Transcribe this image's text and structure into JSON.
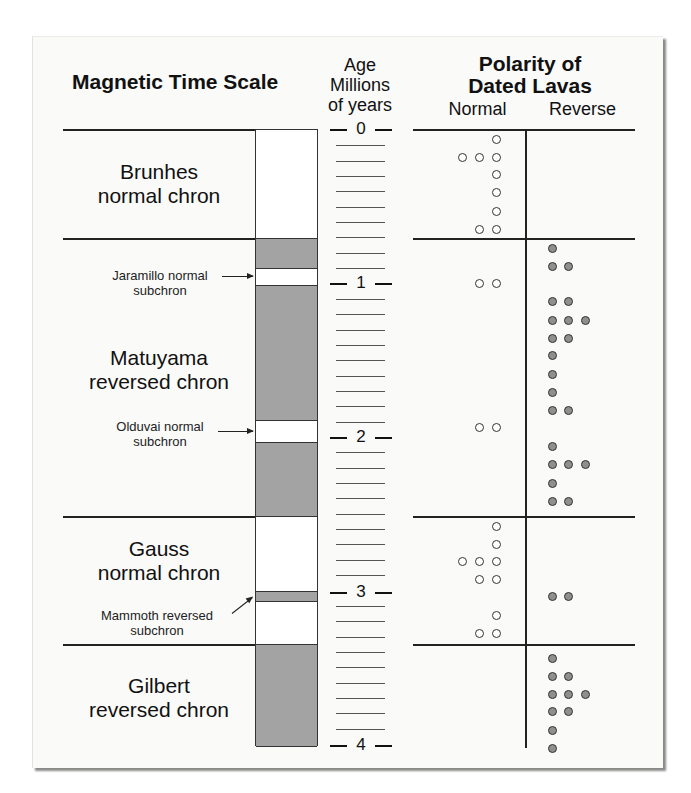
{
  "figure": {
    "title_left": "Magnetic Time Scale",
    "age_header": {
      "line1": "Age",
      "line2": "Millions",
      "line3": "of years"
    },
    "polarity_header": {
      "line1": "Polarity of",
      "line2": "Dated Lavas"
    },
    "column_normal": "Normal",
    "column_reverse": "Reverse",
    "colors": {
      "reversed_fill": "#a3a3a3",
      "normal_fill": "#ffffff",
      "reverse_dot": "#8f8f8f",
      "normal_dot": "#ffffff"
    }
  },
  "chrons": [
    {
      "name_line1": "Brunhes",
      "name_line2": "normal chron",
      "polarity": "normal",
      "start_ma": 0,
      "end_ma": 0.7
    },
    {
      "name_line1": "Matuyama",
      "name_line2": "reversed chron",
      "polarity": "reversed",
      "start_ma": 0.7,
      "end_ma": 2.5
    },
    {
      "name_line1": "Gauss",
      "name_line2": "normal chron",
      "polarity": "normal",
      "start_ma": 2.5,
      "end_ma": 3.3
    },
    {
      "name_line1": "Gilbert",
      "name_line2": "reversed chron",
      "polarity": "reversed",
      "start_ma": 3.3,
      "end_ma": 4.0
    }
  ],
  "subchrons": [
    {
      "name_line1": "Jaramillo normal",
      "name_line2": "subchron",
      "polarity": "normal",
      "start_ma": 0.9,
      "end_ma": 1.0
    },
    {
      "name_line1": "Olduvai normal",
      "name_line2": "subchron",
      "polarity": "normal",
      "start_ma": 1.9,
      "end_ma": 2.0
    },
    {
      "name_line1": "Mammoth reversed",
      "name_line2": "subchron",
      "polarity": "reversed",
      "start_ma": 3.0,
      "end_ma": 3.1
    }
  ],
  "age_axis": {
    "labels": [
      "0",
      "1",
      "2",
      "3",
      "4"
    ],
    "minor_ticks_per_unit": 9,
    "range_ma": [
      0,
      4
    ]
  },
  "chart_data": {
    "type": "scatter",
    "ylabel": "Age (Millions of years)",
    "ylim": [
      0,
      4
    ],
    "categories": [
      "Normal",
      "Reverse"
    ],
    "series": [
      {
        "name": "Normal",
        "points": [
          {
            "age": 0.06,
            "count": 1
          },
          {
            "age": 0.18,
            "count": 3
          },
          {
            "age": 0.29,
            "count": 1
          },
          {
            "age": 0.41,
            "count": 1
          },
          {
            "age": 0.53,
            "count": 1
          },
          {
            "age": 0.65,
            "count": 2
          },
          {
            "age": 1.0,
            "count": 2
          },
          {
            "age": 1.94,
            "count": 2
          },
          {
            "age": 2.58,
            "count": 1
          },
          {
            "age": 2.7,
            "count": 1
          },
          {
            "age": 2.81,
            "count": 3
          },
          {
            "age": 2.93,
            "count": 2
          },
          {
            "age": 3.16,
            "count": 1
          },
          {
            "age": 3.28,
            "count": 2
          }
        ]
      },
      {
        "name": "Reverse",
        "points": [
          {
            "age": 0.77,
            "count": 1
          },
          {
            "age": 0.89,
            "count": 2
          },
          {
            "age": 1.12,
            "count": 2
          },
          {
            "age": 1.24,
            "count": 3
          },
          {
            "age": 1.36,
            "count": 2
          },
          {
            "age": 1.47,
            "count": 1
          },
          {
            "age": 1.59,
            "count": 1
          },
          {
            "age": 1.71,
            "count": 1
          },
          {
            "age": 1.83,
            "count": 2
          },
          {
            "age": 2.06,
            "count": 1
          },
          {
            "age": 2.18,
            "count": 3
          },
          {
            "age": 2.3,
            "count": 1
          },
          {
            "age": 2.42,
            "count": 2
          },
          {
            "age": 3.04,
            "count": 2
          },
          {
            "age": 3.44,
            "count": 1
          },
          {
            "age": 3.56,
            "count": 2
          },
          {
            "age": 3.68,
            "count": 3
          },
          {
            "age": 3.79,
            "count": 2
          },
          {
            "age": 3.91,
            "count": 1
          },
          {
            "age": 4.03,
            "count": 1
          }
        ]
      }
    ]
  }
}
